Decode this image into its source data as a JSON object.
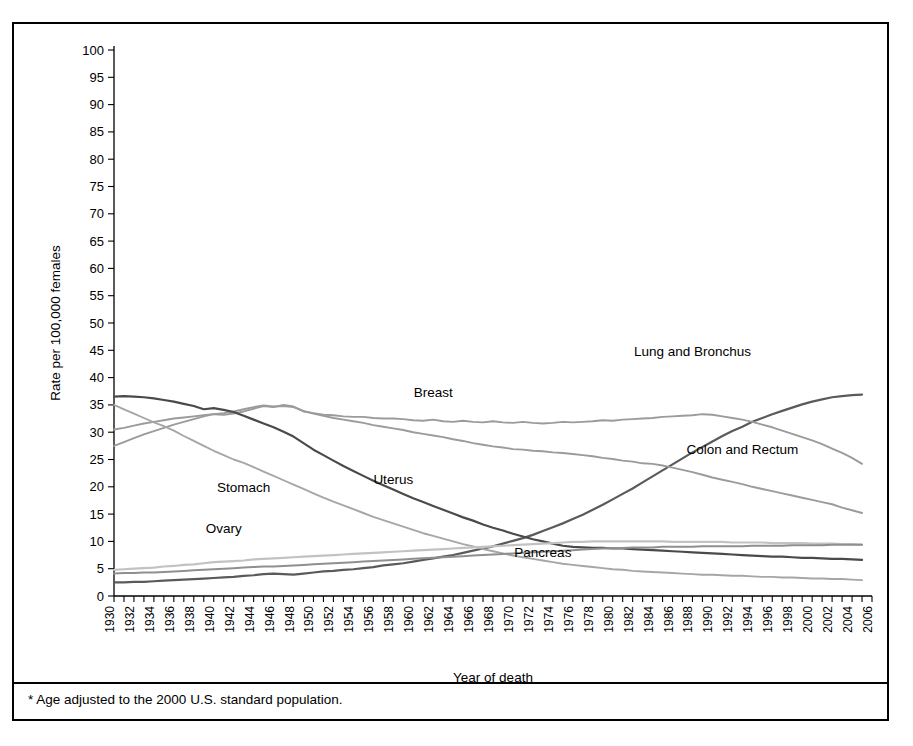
{
  "footnote": {
    "text": "* Age adjusted to the 2000 U.S. standard population."
  },
  "axes": {
    "x_title": "Year of death",
    "y_title": "Rate per 100,000 females"
  },
  "chart_data": {
    "type": "line",
    "title": "",
    "xlabel": "Year of death",
    "ylabel": "Rate per 100,000 females",
    "xlim": [
      1930,
      2006
    ],
    "ylim": [
      0,
      100
    ],
    "grid": false,
    "legend_position": "inline-labels",
    "y_ticks": [
      0,
      5,
      10,
      15,
      20,
      25,
      30,
      35,
      40,
      45,
      50,
      55,
      60,
      65,
      70,
      75,
      80,
      85,
      90,
      95,
      100
    ],
    "x_ticks_labeled": [
      1930,
      1932,
      1934,
      1936,
      1938,
      1940,
      1942,
      1944,
      1946,
      1948,
      1950,
      1952,
      1954,
      1956,
      1958,
      1960,
      1962,
      1964,
      1966,
      1968,
      1970,
      1972,
      1974,
      1976,
      1978,
      1980,
      1982,
      1984,
      1986,
      1988,
      1990,
      1992,
      1994,
      1996,
      1998,
      2000,
      2002,
      2004,
      2006
    ],
    "x_tick_interval_minor": 1,
    "x": [
      1930,
      1931,
      1932,
      1933,
      1934,
      1935,
      1936,
      1937,
      1938,
      1939,
      1940,
      1941,
      1942,
      1943,
      1944,
      1945,
      1946,
      1947,
      1948,
      1949,
      1950,
      1951,
      1952,
      1953,
      1954,
      1955,
      1956,
      1957,
      1958,
      1959,
      1960,
      1961,
      1962,
      1963,
      1964,
      1965,
      1966,
      1967,
      1968,
      1969,
      1970,
      1971,
      1972,
      1973,
      1974,
      1975,
      1976,
      1977,
      1978,
      1979,
      1980,
      1981,
      1982,
      1983,
      1984,
      1985,
      1986,
      1987,
      1988,
      1989,
      1990,
      1991,
      1992,
      1993,
      1994,
      1995,
      1996,
      1997,
      1998,
      1999,
      2000,
      2001,
      2002,
      2003,
      2004,
      2005
    ],
    "series": [
      {
        "name": "Lung and Bronchus",
        "color": "#5a5a5a",
        "width": 2.2,
        "label_x": 1988,
        "label_y": 44,
        "values": [
          2.5,
          2.5,
          2.6,
          2.6,
          2.7,
          2.8,
          2.9,
          3.0,
          3.1,
          3.2,
          3.3,
          3.4,
          3.5,
          3.7,
          3.8,
          4.0,
          4.1,
          4.0,
          3.9,
          4.1,
          4.3,
          4.5,
          4.6,
          4.8,
          4.9,
          5.1,
          5.3,
          5.6,
          5.8,
          6.0,
          6.3,
          6.6,
          6.9,
          7.2,
          7.5,
          7.9,
          8.3,
          8.7,
          9.1,
          9.6,
          10.1,
          10.6,
          11.2,
          11.9,
          12.6,
          13.3,
          14.1,
          14.9,
          15.8,
          16.7,
          17.7,
          18.7,
          19.7,
          20.8,
          21.9,
          23.0,
          24.1,
          25.2,
          26.3,
          27.3,
          28.3,
          29.3,
          30.2,
          31.0,
          31.9,
          32.6,
          33.3,
          33.9,
          34.5,
          35.1,
          35.6,
          36.0,
          36.4,
          36.6,
          36.8,
          36.9
        ]
      },
      {
        "name": "Breast",
        "color": "#9b9b9b",
        "width": 1.9,
        "label_x": 1962,
        "label_y": 36.5,
        "values": [
          30.5,
          30.8,
          31.2,
          31.6,
          31.9,
          32.2,
          32.5,
          32.7,
          32.9,
          33.1,
          33.3,
          33.2,
          33.4,
          33.8,
          34.3,
          34.8,
          34.6,
          35.0,
          34.7,
          33.8,
          33.5,
          33.2,
          33.1,
          32.9,
          32.8,
          32.8,
          32.6,
          32.5,
          32.5,
          32.4,
          32.2,
          32.1,
          32.3,
          32.0,
          31.9,
          32.1,
          31.9,
          31.8,
          32.0,
          31.8,
          31.7,
          31.9,
          31.7,
          31.6,
          31.7,
          31.9,
          31.8,
          31.9,
          32.0,
          32.2,
          32.1,
          32.3,
          32.4,
          32.5,
          32.6,
          32.8,
          32.9,
          33.0,
          33.1,
          33.3,
          33.2,
          32.9,
          32.6,
          32.3,
          31.9,
          31.4,
          30.9,
          30.3,
          29.7,
          29.1,
          28.5,
          27.8,
          27.0,
          26.2,
          25.3,
          24.2
        ]
      },
      {
        "name": "Colon and Rectum",
        "color": "#9b9b9b",
        "width": 1.9,
        "label_x": 1993,
        "label_y": 26,
        "values": [
          27.5,
          28.2,
          28.9,
          29.6,
          30.2,
          30.8,
          31.4,
          31.9,
          32.4,
          32.9,
          33.3,
          33.5,
          33.8,
          34.2,
          34.6,
          34.9,
          34.7,
          34.8,
          34.6,
          33.9,
          33.4,
          33.0,
          32.6,
          32.3,
          32.0,
          31.7,
          31.3,
          31.0,
          30.7,
          30.4,
          30.0,
          29.7,
          29.4,
          29.1,
          28.7,
          28.4,
          28.0,
          27.7,
          27.4,
          27.2,
          26.9,
          26.8,
          26.6,
          26.5,
          26.3,
          26.2,
          26.0,
          25.8,
          25.6,
          25.3,
          25.1,
          24.8,
          24.6,
          24.3,
          24.2,
          23.9,
          23.5,
          23.1,
          22.7,
          22.2,
          21.7,
          21.3,
          20.9,
          20.5,
          20.0,
          19.6,
          19.2,
          18.8,
          18.4,
          18.0,
          17.6,
          17.2,
          16.8,
          16.2,
          15.7,
          15.2
        ]
      },
      {
        "name": "Uterus",
        "color": "#4a4a4a",
        "width": 2.2,
        "label_x": 1958,
        "label_y": 20.5,
        "values": [
          36.5,
          36.6,
          36.5,
          36.4,
          36.2,
          35.9,
          35.6,
          35.2,
          34.8,
          34.2,
          34.4,
          34.1,
          33.7,
          33.0,
          32.3,
          31.6,
          30.9,
          30.1,
          29.2,
          28.0,
          26.8,
          25.8,
          24.8,
          23.8,
          22.9,
          22.0,
          21.1,
          20.3,
          19.5,
          18.7,
          17.9,
          17.2,
          16.5,
          15.8,
          15.1,
          14.4,
          13.8,
          13.1,
          12.5,
          12.0,
          11.4,
          10.9,
          10.4,
          10.0,
          9.6,
          9.2,
          9.0,
          8.9,
          8.8,
          8.8,
          8.7,
          8.7,
          8.6,
          8.5,
          8.4,
          8.3,
          8.2,
          8.1,
          8.0,
          7.9,
          7.8,
          7.7,
          7.6,
          7.5,
          7.4,
          7.3,
          7.2,
          7.2,
          7.1,
          7.0,
          7.0,
          6.9,
          6.8,
          6.8,
          6.7,
          6.6
        ]
      },
      {
        "name": "Stomach",
        "color": "#a6a6a6",
        "width": 1.9,
        "label_x": 1943,
        "label_y": 19,
        "values": [
          35.0,
          34.2,
          33.4,
          32.6,
          31.8,
          31.1,
          30.3,
          29.3,
          28.4,
          27.5,
          26.6,
          25.8,
          25.0,
          24.4,
          23.6,
          22.8,
          22.0,
          21.2,
          20.4,
          19.6,
          18.8,
          18.0,
          17.3,
          16.6,
          15.9,
          15.2,
          14.5,
          13.9,
          13.3,
          12.7,
          12.1,
          11.5,
          11.0,
          10.5,
          10.0,
          9.5,
          9.1,
          8.6,
          8.2,
          7.8,
          7.4,
          7.1,
          6.8,
          6.5,
          6.2,
          5.9,
          5.7,
          5.5,
          5.3,
          5.1,
          4.9,
          4.8,
          4.6,
          4.5,
          4.4,
          4.3,
          4.2,
          4.1,
          4.0,
          3.9,
          3.9,
          3.8,
          3.7,
          3.7,
          3.6,
          3.5,
          3.5,
          3.4,
          3.4,
          3.3,
          3.2,
          3.2,
          3.1,
          3.1,
          3.0,
          2.9
        ]
      },
      {
        "name": "Ovary",
        "color": "#c2c2c2",
        "width": 2.2,
        "label_x": 1941,
        "label_y": 11.5,
        "values": [
          4.8,
          4.9,
          5.0,
          5.1,
          5.2,
          5.4,
          5.5,
          5.7,
          5.8,
          6.0,
          6.2,
          6.3,
          6.4,
          6.5,
          6.7,
          6.8,
          6.9,
          7.0,
          7.1,
          7.2,
          7.3,
          7.4,
          7.5,
          7.6,
          7.7,
          7.8,
          7.9,
          8.0,
          8.1,
          8.2,
          8.3,
          8.4,
          8.5,
          8.6,
          8.7,
          8.8,
          8.9,
          9.0,
          9.1,
          9.2,
          9.3,
          9.4,
          9.5,
          9.6,
          9.7,
          9.8,
          9.9,
          9.9,
          10.0,
          10.0,
          10.0,
          10.0,
          10.0,
          10.0,
          10.0,
          10.0,
          9.9,
          9.9,
          9.9,
          9.9,
          9.9,
          9.9,
          9.8,
          9.8,
          9.8,
          9.8,
          9.7,
          9.7,
          9.7,
          9.7,
          9.6,
          9.6,
          9.6,
          9.5,
          9.5,
          9.4
        ]
      },
      {
        "name": "Pancreas",
        "color": "#8f8f8f",
        "width": 2.0,
        "label_x": 1973,
        "label_y": 7.2,
        "values": [
          4.1,
          4.2,
          4.2,
          4.3,
          4.3,
          4.4,
          4.5,
          4.6,
          4.7,
          4.8,
          4.9,
          5.0,
          5.1,
          5.2,
          5.3,
          5.4,
          5.4,
          5.5,
          5.6,
          5.7,
          5.8,
          5.9,
          6.0,
          6.1,
          6.2,
          6.3,
          6.4,
          6.5,
          6.6,
          6.7,
          6.8,
          6.9,
          7.0,
          7.1,
          7.2,
          7.3,
          7.4,
          7.5,
          7.6,
          7.7,
          7.8,
          7.9,
          8.0,
          8.1,
          8.2,
          8.3,
          8.4,
          8.5,
          8.6,
          8.7,
          8.8,
          8.8,
          8.9,
          8.9,
          8.9,
          9.0,
          9.0,
          9.0,
          9.0,
          9.1,
          9.1,
          9.1,
          9.1,
          9.1,
          9.2,
          9.2,
          9.2,
          9.2,
          9.3,
          9.3,
          9.3,
          9.3,
          9.4,
          9.4,
          9.4,
          9.4
        ]
      }
    ]
  }
}
